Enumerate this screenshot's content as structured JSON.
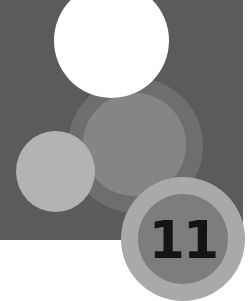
{
  "badge": {
    "number": "11"
  },
  "colors": {
    "panel": "#5b5b5b",
    "white_circle": "#ffffff",
    "middle_ring": "#6e6e6e",
    "middle_inner": "#858585",
    "small_light_circle": "#b3b3b3",
    "badge_ring": "#a9a9a9",
    "badge_inner": "#7d7d7d",
    "badge_text": "#141414"
  },
  "shapes": [
    {
      "name": "middle-ring-circle",
      "cx": 135.5,
      "cy": 145.5,
      "r": 67.5
    },
    {
      "name": "middle-inner-circle",
      "cx": 134.5,
      "cy": 144.5,
      "r": 51.5
    },
    {
      "name": "white-circle",
      "cx": 111.5,
      "cy": 40.5,
      "r": 57.5
    },
    {
      "name": "small-light-circle",
      "cx": 55.5,
      "cy": 171.5,
      "r": 40
    },
    {
      "name": "badge-ring",
      "cx": 183,
      "cy": 239,
      "r": 62
    },
    {
      "name": "badge-inner",
      "cx": 182.5,
      "cy": 240,
      "r": 45
    }
  ]
}
